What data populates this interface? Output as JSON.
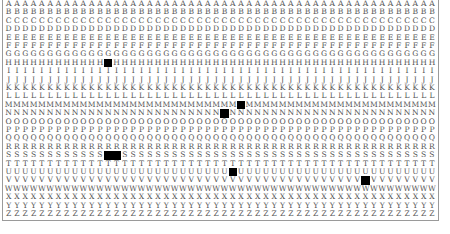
{
  "grid": {
    "rows": [
      "A",
      "B",
      "C",
      "D",
      "E",
      "F",
      "G",
      "H",
      "I",
      "J",
      "K",
      "L",
      "M",
      "N",
      "O",
      "P",
      "Q",
      "R",
      "S",
      "T",
      "U",
      "V",
      "W",
      "X",
      "Y",
      "Z"
    ],
    "columns": 52,
    "black_cells": [
      {
        "row": "H",
        "col": 12
      },
      {
        "row": "M",
        "col": 28
      },
      {
        "row": "N",
        "col": 26
      },
      {
        "row": "S",
        "col": 12
      },
      {
        "row": "S",
        "col": 13
      },
      {
        "row": "U",
        "col": 27
      },
      {
        "row": "V",
        "col": 43
      }
    ],
    "colors": {
      "text": "#555555",
      "black": "#000000",
      "border": "#9a9a9a",
      "background": "#ffffff"
    }
  }
}
